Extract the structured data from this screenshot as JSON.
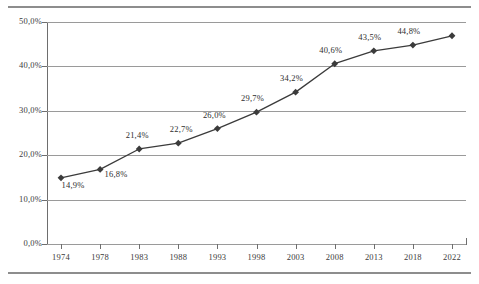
{
  "chart_data": {
    "type": "line",
    "title": "",
    "subtitle": "",
    "xlabel": "",
    "ylabel": "",
    "categories": [
      "1974",
      "1978",
      "1983",
      "1988",
      "1993",
      "1998",
      "2003",
      "2008",
      "2013",
      "2018",
      "2022"
    ],
    "values": [
      14.9,
      16.8,
      21.4,
      22.7,
      26.0,
      29.7,
      34.2,
      40.6,
      43.5,
      44.8,
      46.9
    ],
    "point_labels": [
      "14,9%",
      "16,8%",
      "21,4%",
      "22,7%",
      "26,0%",
      "29,7%",
      "34,2%",
      "40,6%",
      "43,5%",
      "44,8%",
      "46,9%"
    ],
    "labels_shown": [
      true,
      true,
      true,
      true,
      true,
      true,
      true,
      true,
      true,
      true,
      false
    ],
    "ylim": [
      0,
      50
    ],
    "yticks": [
      0,
      10,
      20,
      30,
      40,
      50
    ],
    "ytick_labels": [
      "0,0%",
      "10,0%",
      "20,0%",
      "30,0%",
      "40,0%",
      "50,0%"
    ],
    "grid": true,
    "grid_axis": "y",
    "legend": false,
    "legend_position": "none",
    "series": [
      {
        "name": "",
        "marker": "diamond",
        "line_color": "#3b3b3b",
        "marker_color": "#3b3b3b",
        "values": [
          14.9,
          16.8,
          21.4,
          22.7,
          26.0,
          29.7,
          34.2,
          40.6,
          43.5,
          44.8,
          46.9
        ]
      }
    ]
  },
  "colors": {
    "background": "#ffffff",
    "gridline": "#9a9a9a",
    "axis": "#6e6e6e",
    "frame_rule": "#8d8d8d",
    "text": "#3b3b3b",
    "series_line": "#3b3b3b"
  }
}
